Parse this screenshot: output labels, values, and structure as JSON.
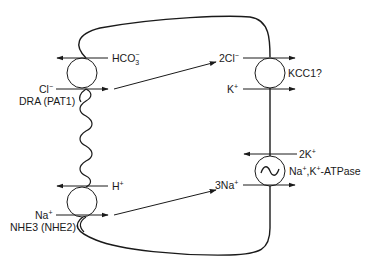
{
  "diagram": {
    "type": "epithelial cell ion transport schematic",
    "colors": {
      "line": "#1a1a1a",
      "background": "#ffffff"
    },
    "apical_transporters": [
      {
        "id": "dra",
        "name": "DRA (PAT1)",
        "out_label": "HCO",
        "out_sub": "3",
        "out_sup": "−",
        "in_label": "Cl",
        "in_sup": "−"
      },
      {
        "id": "nhe3",
        "name": "NHE3 (NHE2)",
        "out_label": "H",
        "out_sup": "+",
        "in_label": "Na",
        "in_sup": "+"
      }
    ],
    "basolateral_transporters": [
      {
        "id": "kcc1",
        "name": "KCC1?",
        "top_label": "2Cl",
        "top_sup": "−",
        "bottom_label": "K",
        "bottom_sup": "+"
      },
      {
        "id": "nak_atpase",
        "name_a": "Na",
        "name_a_sup": "+",
        "name_b": ",K",
        "name_b_sup": "+",
        "name_c": "-ATPase",
        "top_label": "2K",
        "top_sup": "+",
        "bottom_label": "3Na",
        "bottom_sup": "+",
        "symbol": "~"
      }
    ]
  }
}
